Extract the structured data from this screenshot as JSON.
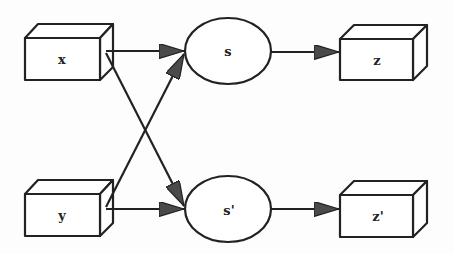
{
  "diagram": {
    "type": "flow",
    "colors": {
      "stroke": "#222222",
      "fill": "#ffffff",
      "arrowhead": "#444444"
    },
    "nodes": [
      {
        "id": "x",
        "label": "x",
        "shape": "box3d"
      },
      {
        "id": "y",
        "label": "y",
        "shape": "box3d"
      },
      {
        "id": "s",
        "label": "s",
        "shape": "ellipse"
      },
      {
        "id": "s_prime",
        "label": "s'",
        "shape": "ellipse"
      },
      {
        "id": "z",
        "label": "z",
        "shape": "box3d"
      },
      {
        "id": "z_prime",
        "label": "z'",
        "shape": "box3d"
      }
    ],
    "edges": [
      {
        "from": "x",
        "to": "s"
      },
      {
        "from": "x",
        "to": "s'"
      },
      {
        "from": "y",
        "to": "s"
      },
      {
        "from": "y",
        "to": "s'"
      },
      {
        "from": "s",
        "to": "z"
      },
      {
        "from": "s'",
        "to": "z'"
      }
    ]
  }
}
